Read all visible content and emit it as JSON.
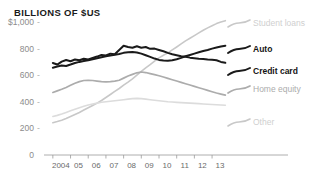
{
  "chart_data": {
    "type": "line",
    "title": "BILLIONS OF $US",
    "xlabel": "",
    "ylabel": "",
    "ylim": [
      0,
      1000
    ],
    "xlim": [
      2003.5,
      2013.9
    ],
    "grid": false,
    "legend_position": "right",
    "y_ticks": [
      "$1,000",
      "800",
      "600",
      "400",
      "200",
      "0"
    ],
    "y_tick_values": [
      1000,
      800,
      600,
      400,
      200,
      0
    ],
    "x_ticks": [
      "2004",
      "05",
      "06",
      "07",
      "08",
      "09",
      "10",
      "11",
      "12",
      "13"
    ],
    "x_tick_values": [
      2004,
      2005,
      2006,
      2007,
      2008,
      2009,
      2010,
      2011,
      2012,
      2013
    ],
    "x": [
      2004,
      2004.25,
      2004.5,
      2004.75,
      2005,
      2005.25,
      2005.5,
      2005.75,
      2006,
      2006.25,
      2006.5,
      2006.75,
      2007,
      2007.25,
      2007.5,
      2007.75,
      2008,
      2008.25,
      2008.5,
      2008.75,
      2009,
      2009.25,
      2009.5,
      2009.75,
      2010,
      2010.25,
      2010.5,
      2010.75,
      2011,
      2011.25,
      2011.5,
      2011.75,
      2012,
      2012.25,
      2012.5,
      2012.75,
      2013,
      2013.25,
      2013.5,
      2013.75
    ],
    "series": [
      {
        "name": "Student loans",
        "color": "#c8c8c8",
        "width": 1.6,
        "values": [
          243,
          252,
          262,
          275,
          290,
          305,
          320,
          338,
          355,
          372,
          390,
          410,
          432,
          455,
          478,
          500,
          525,
          548,
          572,
          600,
          628,
          655,
          680,
          706,
          730,
          750,
          768,
          790,
          812,
          835,
          858,
          878,
          898,
          918,
          938,
          956,
          972,
          988,
          1000,
          1010
        ]
      },
      {
        "name": "Auto",
        "color": "#1a1a1a",
        "width": 2.0,
        "values": [
          656,
          665,
          673,
          669,
          680,
          692,
          700,
          706,
          712,
          720,
          728,
          735,
          742,
          748,
          753,
          760,
          768,
          772,
          774,
          770,
          762,
          750,
          738,
          725,
          715,
          710,
          708,
          712,
          720,
          730,
          742,
          752,
          762,
          772,
          782,
          790,
          800,
          808,
          816,
          822
        ]
      },
      {
        "name": "Credit card",
        "color": "#1a1a1a",
        "width": 2.0,
        "values": [
          692,
          680,
          702,
          714,
          705,
          718,
          712,
          724,
          718,
          730,
          740,
          752,
          748,
          762,
          758,
          790,
          822,
          812,
          806,
          818,
          806,
          812,
          798,
          800,
          790,
          780,
          768,
          758,
          750,
          742,
          738,
          732,
          728,
          724,
          722,
          718,
          716,
          712,
          700,
          694
        ]
      },
      {
        "name": "Home equity",
        "color": "#acacac",
        "width": 1.7,
        "values": [
          470,
          482,
          494,
          508,
          524,
          540,
          552,
          560,
          562,
          560,
          556,
          552,
          550,
          552,
          556,
          562,
          578,
          594,
          606,
          618,
          624,
          620,
          612,
          604,
          596,
          586,
          576,
          566,
          556,
          546,
          536,
          526,
          516,
          506,
          496,
          486,
          476,
          466,
          458,
          450
        ]
      },
      {
        "name": "Other",
        "color": "#dcdcdc",
        "width": 1.6,
        "values": [
          290,
          298,
          308,
          320,
          332,
          344,
          356,
          366,
          376,
          384,
          390,
          396,
          400,
          404,
          408,
          412,
          416,
          420,
          424,
          426,
          424,
          420,
          416,
          412,
          408,
          404,
          400,
          398,
          396,
          394,
          392,
          390,
          388,
          386,
          384,
          382,
          380,
          378,
          376,
          374
        ]
      }
    ],
    "legend": [
      {
        "label": "Student loans",
        "style": "gray-light",
        "y": 24
      },
      {
        "label": "Auto",
        "style": "bold",
        "y": 50
      },
      {
        "label": "Credit card",
        "style": "bold",
        "y": 72
      },
      {
        "label": "Home equity",
        "style": "gray-dark",
        "y": 90
      },
      {
        "label": "Other",
        "style": "gray-light",
        "y": 123
      }
    ]
  }
}
